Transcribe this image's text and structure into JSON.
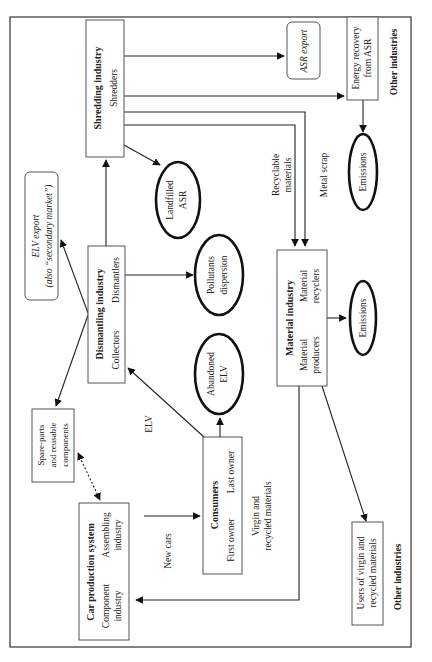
{
  "diagram": {
    "orientation": "rotated-90-ccw",
    "nodes": {
      "shredding": {
        "title": "Shredding industry",
        "sub": "Shredders"
      },
      "asr_export": {
        "label": "ASR export"
      },
      "energy_recovery": {
        "line1": "Energy recovery",
        "line2": "from ASR"
      },
      "other_industries_top": {
        "label": "Other industries"
      },
      "landfilled_asr": {
        "line1": "Landfilled",
        "line2": "ASR"
      },
      "emissions_top": {
        "label": "Emissions"
      },
      "elv_export": {
        "line1": "ELV export",
        "line2": "(also “secondary market”)"
      },
      "dismantling": {
        "title": "Dismantling industry",
        "sub_left": "Collectors",
        "sub_right": "Dismantlers"
      },
      "pollutants": {
        "line1": "Pollutants",
        "line2": "dispersion"
      },
      "abandoned_elv": {
        "line1": "Abandoned",
        "line2": "ELV"
      },
      "material": {
        "title": "Material industry",
        "sub_left_1": "Material",
        "sub_left_2": "producers",
        "sub_right_1": "Material",
        "sub_right_2": "recyclers"
      },
      "emissions_mid": {
        "label": "Emissions"
      },
      "spare_parts": {
        "line1": "Spare-parts",
        "line2": "and reusable",
        "line3": "components"
      },
      "car_production": {
        "title": "Car production system",
        "sub_left_1": "Component",
        "sub_left_2": "industry",
        "sub_right_1": "Assembling",
        "sub_right_2": "industry"
      },
      "consumers": {
        "title": "Consumers",
        "sub_left": "First owner",
        "sub_right": "Last owner"
      },
      "users_materials": {
        "line1": "Users of virgin and",
        "line2": "recycled materials"
      },
      "other_industries_bottom": {
        "label": "Other industries"
      }
    },
    "edge_labels": {
      "recyclable": {
        "line1": "Recyclable",
        "line2": "materials"
      },
      "metal_scrap": "Metal scrap",
      "elv": "ELV",
      "new_cars": "New cars",
      "virgin_recycled": {
        "line1": "Virgin and",
        "line2": "recycled materials"
      }
    }
  }
}
